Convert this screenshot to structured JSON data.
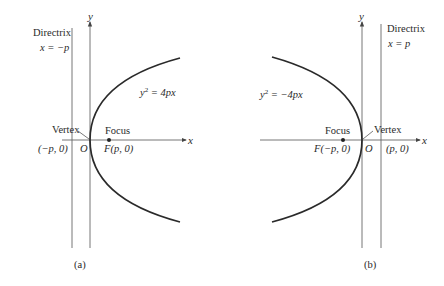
{
  "panel_a": {
    "caption": "(a)",
    "axis_x": "x",
    "axis_y": "y",
    "directrix_title": "Directrix",
    "directrix_eq": "x = −p",
    "equation_base": "y",
    "equation_exp": "2",
    "equation_rest": " = 4px",
    "vertex_label": "Vertex",
    "focus_label": "Focus",
    "origin_label": "O",
    "directrix_point": "(−p,  0)",
    "focus_point": "F(p,  0)"
  },
  "panel_b": {
    "caption": "(b)",
    "axis_x": "x",
    "axis_y": "y",
    "directrix_title": "Directrix",
    "directrix_eq": "x = p",
    "equation_base": "y",
    "equation_exp": "2",
    "equation_rest": " = −4px",
    "vertex_label": "Vertex",
    "focus_label": "Focus",
    "origin_label": "O",
    "directrix_point": "(p,  0)",
    "focus_point": "F(−p,  0)"
  },
  "colors": {
    "curve": "#2a2a2a",
    "axes": "#555555",
    "text": "#2a2a2a"
  }
}
